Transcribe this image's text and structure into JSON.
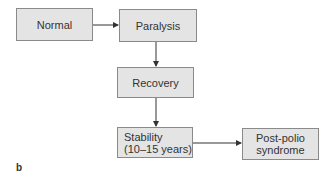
{
  "diagram": {
    "nodes": [
      {
        "id": "normal",
        "label": "Normal"
      },
      {
        "id": "paralysis",
        "label": "Paralysis"
      },
      {
        "id": "recovery",
        "label": "Recovery"
      },
      {
        "id": "stability",
        "label": "Stability\n(10–15 years)"
      },
      {
        "id": "post_polio",
        "label": "Post-polio\nsyndrome"
      }
    ],
    "edges": [
      {
        "from": "normal",
        "to": "paralysis"
      },
      {
        "from": "paralysis",
        "to": "recovery"
      },
      {
        "from": "recovery",
        "to": "stability"
      },
      {
        "from": "stability",
        "to": "post_polio"
      }
    ],
    "panel_label": "b"
  },
  "colors": {
    "box_fill": "#e4e4e4",
    "box_border": "#8a8a8a",
    "arrow": "#333333"
  }
}
